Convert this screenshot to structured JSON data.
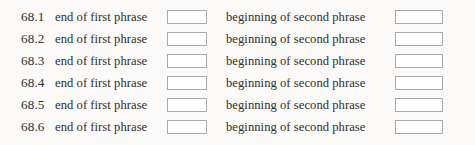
{
  "worksheet": {
    "rows": [
      {
        "number": "68.1",
        "prompt_first": "end of first phrase",
        "prompt_second": "beginning of second phrase",
        "answer_first": "",
        "answer_second": ""
      },
      {
        "number": "68.2",
        "prompt_first": "end of first phrase",
        "prompt_second": "beginning of second phrase",
        "answer_first": "",
        "answer_second": ""
      },
      {
        "number": "68.3",
        "prompt_first": "end of first phrase",
        "prompt_second": "beginning of second phrase",
        "answer_first": "",
        "answer_second": ""
      },
      {
        "number": "68.4",
        "prompt_first": "end of first phrase",
        "prompt_second": "beginning of second phrase",
        "answer_first": "",
        "answer_second": ""
      },
      {
        "number": "68.5",
        "prompt_first": "end of first phrase",
        "prompt_second": "beginning of second phrase",
        "answer_first": "",
        "answer_second": ""
      },
      {
        "number": "68.6",
        "prompt_first": "end of first phrase",
        "prompt_second": "beginning of second phrase",
        "answer_first": "",
        "answer_second": ""
      }
    ],
    "colors": {
      "background": "#fbfaf8",
      "text": "#2f2e2d",
      "box_border": "#a9a9a9",
      "box_fill": "#ffffff"
    }
  }
}
